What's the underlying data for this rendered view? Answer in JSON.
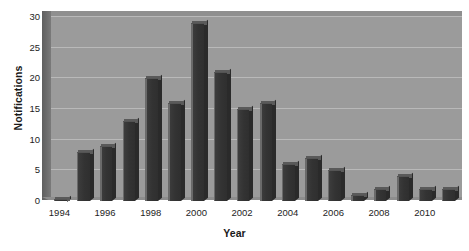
{
  "chart_data": {
    "type": "bar",
    "title": "",
    "subtitle": "",
    "xlabel": "Year",
    "ylabel": "Notifications",
    "categories": [
      1994,
      1995,
      1996,
      1997,
      1998,
      1999,
      2000,
      2001,
      2002,
      2003,
      2004,
      2005,
      2006,
      2007,
      2008,
      2009,
      2010,
      2011
    ],
    "values": [
      0,
      8,
      9,
      13,
      20,
      16,
      29,
      21,
      15,
      16,
      6,
      7,
      5,
      1,
      2,
      4,
      2,
      2
    ],
    "series": [
      {
        "name": "Notifications",
        "values": [
          0,
          8,
          9,
          13,
          20,
          16,
          29,
          21,
          15,
          16,
          6,
          7,
          5,
          1,
          2,
          4,
          2,
          2
        ]
      }
    ],
    "ylim": [
      0,
      30
    ],
    "yticks": [
      0,
      5,
      10,
      15,
      20,
      25,
      30
    ],
    "ytick_labels": [
      "0",
      "5",
      "10",
      "15",
      "20",
      "25",
      "30"
    ],
    "xtick_labels": [
      "1994",
      "1996",
      "1998",
      "2000",
      "2002",
      "2004",
      "2006",
      "2008",
      "2010"
    ],
    "xtick_categories": [
      1994,
      1996,
      1998,
      2000,
      2002,
      2004,
      2006,
      2008,
      2010
    ],
    "grid": true,
    "grid_axis": "y",
    "legend": false,
    "legend_position": "none",
    "style": "3d-column",
    "colors": {
      "bar_face": "#333333",
      "bar_highlight": "#6a6a6a",
      "plot_background": "#9b9b9b",
      "gridline": "#b9b9b9",
      "side_wall": "#6d6d6d",
      "page_background": "#ffffff",
      "text": "#1a1a1a"
    }
  }
}
